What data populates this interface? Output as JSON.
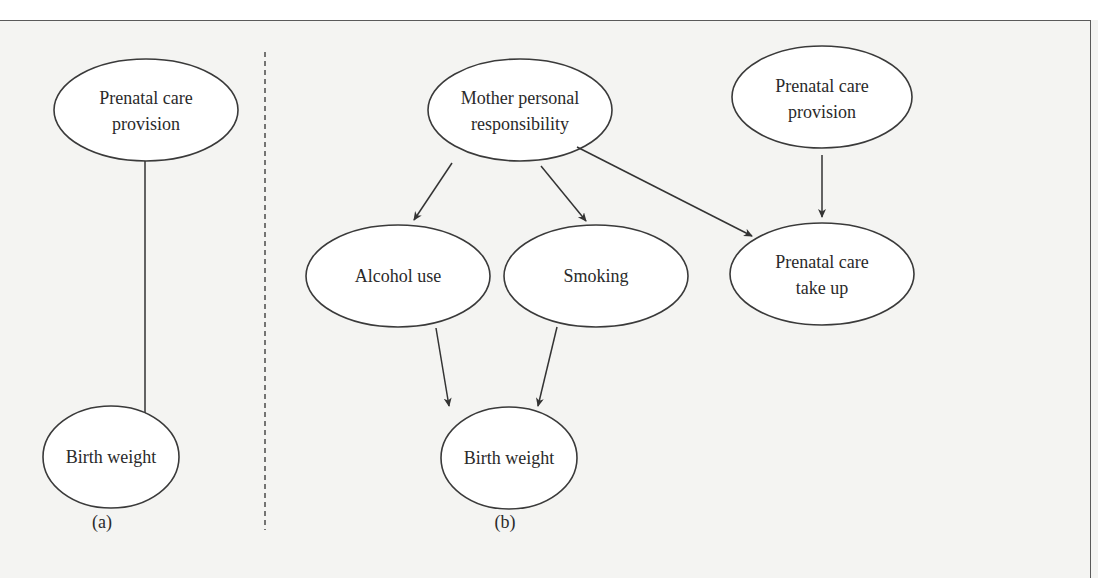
{
  "figure": {
    "panels": [
      {
        "id": "a",
        "label": "(a)",
        "nodes": [
          {
            "id": "a_prenatal_provision",
            "lines": [
              "Prenatal care",
              "provision"
            ]
          },
          {
            "id": "a_birth_weight",
            "lines": [
              "Birth weight"
            ]
          }
        ],
        "edges": [
          {
            "from": "a_prenatal_provision",
            "to": "a_birth_weight"
          }
        ]
      },
      {
        "id": "b",
        "label": "(b)",
        "nodes": [
          {
            "id": "b_mother",
            "lines": [
              "Mother personal",
              "responsibility"
            ]
          },
          {
            "id": "b_prenatal_provision",
            "lines": [
              "Prenatal care",
              "provision"
            ]
          },
          {
            "id": "b_alcohol",
            "lines": [
              "Alcohol use"
            ]
          },
          {
            "id": "b_smoking",
            "lines": [
              "Smoking"
            ]
          },
          {
            "id": "b_prenatal_takeup",
            "lines": [
              "Prenatal care",
              "take up"
            ]
          },
          {
            "id": "b_birth_weight",
            "lines": [
              "Birth weight"
            ]
          }
        ],
        "edges": [
          {
            "from": "b_mother",
            "to": "b_alcohol"
          },
          {
            "from": "b_mother",
            "to": "b_smoking"
          },
          {
            "from": "b_mother",
            "to": "b_prenatal_takeup"
          },
          {
            "from": "b_prenatal_provision",
            "to": "b_prenatal_takeup"
          },
          {
            "from": "b_alcohol",
            "to": "b_birth_weight"
          },
          {
            "from": "b_smoking",
            "to": "b_birth_weight"
          }
        ]
      }
    ]
  },
  "text": {
    "a_prenatal_l1": "Prenatal care",
    "a_prenatal_l2": "provision",
    "a_birth": "Birth weight",
    "a_label": "(a)",
    "b_mother_l1": "Mother personal",
    "b_mother_l2": "responsibility",
    "b_provision_l1": "Prenatal care",
    "b_provision_l2": "provision",
    "b_alcohol": "Alcohol use",
    "b_smoking": "Smoking",
    "b_takeup_l1": "Prenatal care",
    "b_takeup_l2": "take up",
    "b_birth": "Birth weight",
    "b_label": "(b)"
  },
  "colors": {
    "background": "#f4f4f2",
    "node_fill": "#ffffff",
    "stroke": "#3a3a3a",
    "text": "#2a2a2a"
  }
}
